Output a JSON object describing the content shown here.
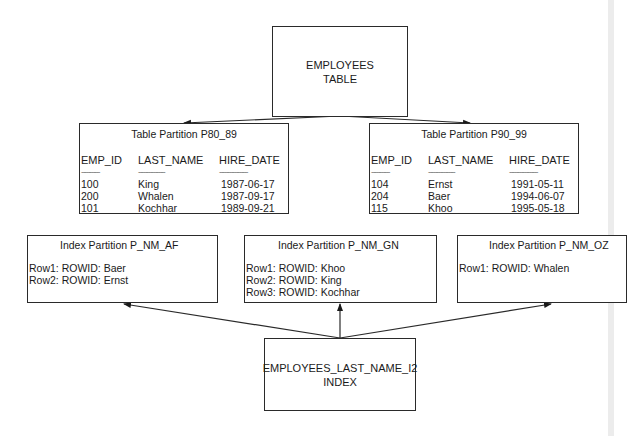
{
  "diagram": {
    "root": {
      "line1": "EMPLOYEES",
      "line2": "TABLE"
    },
    "table_partitions": [
      {
        "title": "Table Partition P80_89",
        "columns": [
          "EMP_ID",
          "LAST_NAME",
          "HIRE_DATE"
        ],
        "separator": [
          "-----------",
          "----------------",
          "-----------------"
        ],
        "rows": [
          [
            "100",
            "King",
            "1987-06-17"
          ],
          [
            "200",
            "Whalen",
            "1987-09-17"
          ],
          [
            "101",
            "Kochhar",
            "1989-09-21"
          ]
        ]
      },
      {
        "title": "Table Partition P90_99",
        "columns": [
          "EMP_ID",
          "LAST_NAME",
          "HIRE_DATE"
        ],
        "separator": [
          "-----------",
          "----------------",
          "-----------------"
        ],
        "rows": [
          [
            "104",
            "Ernst",
            "1991-05-11"
          ],
          [
            "204",
            "Baer",
            "1994-06-07"
          ],
          [
            "115",
            "Khoo",
            "1995-05-18"
          ]
        ]
      }
    ],
    "index_partitions": [
      {
        "title": "Index Partition P_NM_AF",
        "rows": [
          "Row1: ROWID: Baer",
          "Row2: ROWID: Ernst"
        ]
      },
      {
        "title": "Index Partition P_NM_GN",
        "rows": [
          "Row1: ROWID: Khoo",
          "Row2: ROWID: King",
          "Row3: ROWID: Kochhar"
        ]
      },
      {
        "title": "Index Partition P_NM_OZ",
        "rows": [
          "Row1: ROWID: Whalen"
        ]
      }
    ],
    "index": {
      "line1": "EMPLOYEES_LAST_NAME_I2",
      "line2": "INDEX"
    },
    "colors": {
      "line": "#2a2a2a",
      "background": "#ffffff"
    }
  }
}
